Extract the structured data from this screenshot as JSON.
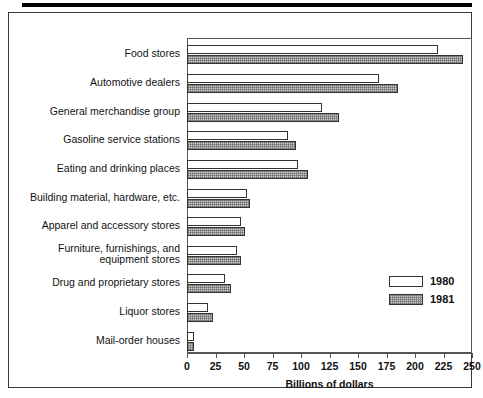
{
  "figure": {
    "x_axis_title": "Billions of dollars"
  },
  "legend": {
    "position": "inside-right",
    "entries": [
      {
        "label": "1980",
        "swatch": "white-open-rect"
      },
      {
        "label": "1981",
        "swatch": "gray-hatched-rect"
      }
    ]
  },
  "colors": {
    "bar_1980_fill": "#ffffff",
    "bar_1981_fill": "#cfcfcf",
    "bar_outline": "#333333",
    "axis": "#555555",
    "frame": "#3a3a3a",
    "rule": "#000000",
    "text": "#111111"
  },
  "chart_data": {
    "type": "bar",
    "orientation": "horizontal",
    "grouped": true,
    "title": "",
    "subtitle": "",
    "xlabel": "Billions of dollars",
    "ylabel": "",
    "xlim": [
      0,
      250
    ],
    "xticks": [
      0,
      25,
      50,
      75,
      100,
      125,
      150,
      175,
      200,
      225,
      250
    ],
    "xtick_labels": [
      "0",
      "25",
      "50",
      "75",
      "100",
      "125",
      "150",
      "175",
      "200",
      "225",
      "250"
    ],
    "grid": false,
    "legend_position": "inside-right",
    "categories": [
      "Food stores",
      "Automotive dealers",
      "General merchandise group",
      "Gasoline service stations",
      "Eating and drinking places",
      "Building material, hardware, etc.",
      "Apparel and accessory stores",
      "Furniture, furnishings, and\nequipment stores",
      "Drug and proprietary stores",
      "Liquor stores",
      "Mail-order houses"
    ],
    "series": [
      {
        "name": "1980",
        "values": [
          220,
          168,
          118,
          89,
          97,
          53,
          47,
          44,
          33,
          18,
          6
        ]
      },
      {
        "name": "1981",
        "values": [
          242,
          185,
          133,
          96,
          106,
          55,
          51,
          47,
          39,
          23,
          6
        ]
      }
    ]
  }
}
